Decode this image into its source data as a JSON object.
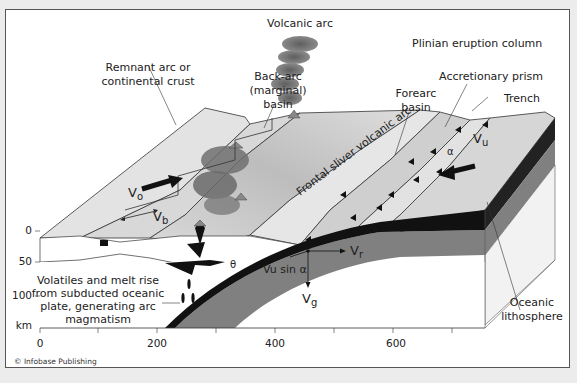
{
  "diagram": {
    "type": "subduction-zone-block-diagram",
    "labels": {
      "volcanic_arc": "Volcanic arc",
      "plinian_column": "Plinian eruption column",
      "remnant_arc_line1": "Remnant arc or",
      "remnant_arc_line2": "continental crust",
      "back_arc_line1": "Back-arc",
      "back_arc_line2": "(marginal)",
      "back_arc_line3": "basin",
      "accretionary_prism": "Accretionary prism",
      "forearc_line1": "Forearc",
      "forearc_line2": "basin",
      "trench": "Trench",
      "frontal_sliver": "Frontal sliver volcanic arc",
      "oceanic_line1": "Oceanic",
      "oceanic_line2": "lithosphere",
      "volatiles_line1": "Volatiles and melt rise",
      "volatiles_line2": "from subducted oceanic",
      "volatiles_line3": "plate, generating arc",
      "volatiles_line4": "magmatism"
    },
    "vectors": {
      "vo": "V",
      "vo_sub": "o",
      "vb": "V",
      "vb_sub": "b",
      "vu": "V",
      "vu_sub": "u",
      "vr": "V",
      "vr_sub": "r",
      "vg": "V",
      "vg_sub": "g",
      "vu_sin": "Vu sin α",
      "alpha": "α",
      "theta": "θ"
    },
    "depth_axis": {
      "ticks": [
        "0",
        "50",
        "100"
      ],
      "unit": "km"
    },
    "distance_axis": {
      "ticks": [
        "0",
        "200",
        "400",
        "600"
      ]
    },
    "credit": "© Infobase Publishing",
    "colors": {
      "slab_black": "#111111",
      "lithosphere_gray": "#7a7a7a",
      "surface_light": "#dcdcdc",
      "block_face": "#f0f0f0",
      "plume_gray": "#6e6e6e"
    }
  }
}
